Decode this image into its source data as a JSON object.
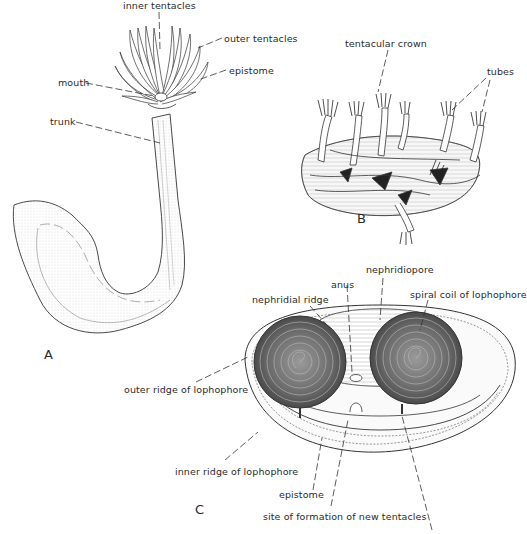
{
  "figure": {
    "panels": [
      {
        "id": "A",
        "letter": "A",
        "description": "whole animal with tentacular crown and trunk",
        "labels": {
          "inner_tentacles": "inner tentacles",
          "outer_tentacles": "outer tentacles",
          "epistome": "epistome",
          "mouth": "mouth",
          "trunk": "trunk"
        }
      },
      {
        "id": "B",
        "letter": "B",
        "description": "colony of intertwined tubes",
        "labels": {
          "tentacular_crown": "tentacular crown",
          "tubes": "tubes"
        }
      },
      {
        "id": "C",
        "letter": "C",
        "description": "lophophore viewed from above",
        "labels": {
          "nephridiopore": "nephridiopore",
          "anus": "anus",
          "nephridial_ridge": "nephridial ridge",
          "spiral_coil": "spiral coil of lophophore",
          "outer_ridge": "outer ridge of lophophore",
          "inner_ridge": "inner ridge of lophophore",
          "epistome": "epistome",
          "new_tentacles": "site of formation of new tentacles"
        }
      }
    ],
    "colors": {
      "ink": "#2a2a2a",
      "background": "#ffffff"
    }
  }
}
